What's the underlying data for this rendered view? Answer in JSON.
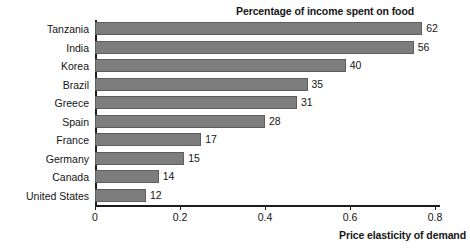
{
  "chart_data": {
    "type": "bar",
    "orientation": "horizontal",
    "title": "Percentage of income spent on food",
    "xlabel": "Price elasticity of demand",
    "ylabel": "",
    "xlim": [
      0,
      0.85
    ],
    "xticks": [
      "0",
      "0.2",
      "0.4",
      "0.6",
      "0.8"
    ],
    "xtick_values": [
      0,
      0.2,
      0.4,
      0.6,
      0.8
    ],
    "grid": false,
    "legend": false,
    "categories": [
      "Tanzania",
      "India",
      "Korea",
      "Brazil",
      "Greece",
      "Spain",
      "France",
      "Germany",
      "Canada",
      "United States"
    ],
    "values": [
      0.77,
      0.75,
      0.59,
      0.5,
      0.475,
      0.4,
      0.25,
      0.21,
      0.15,
      0.12
    ],
    "data_labels": [
      "62",
      "56",
      "40",
      "35",
      "31",
      "28",
      "17",
      "15",
      "14",
      "12"
    ],
    "data_label_meaning": "Percentage of income spent on food",
    "points": [
      {
        "category": "Tanzania",
        "elasticity": 0.77,
        "pct_income_on_food": "62"
      },
      {
        "category": "India",
        "elasticity": 0.75,
        "pct_income_on_food": "56"
      },
      {
        "category": "Korea",
        "elasticity": 0.59,
        "pct_income_on_food": "40"
      },
      {
        "category": "Brazil",
        "elasticity": 0.5,
        "pct_income_on_food": "35"
      },
      {
        "category": "Greece",
        "elasticity": 0.475,
        "pct_income_on_food": "31"
      },
      {
        "category": "Spain",
        "elasticity": 0.4,
        "pct_income_on_food": "28"
      },
      {
        "category": "France",
        "elasticity": 0.25,
        "pct_income_on_food": "17"
      },
      {
        "category": "Germany",
        "elasticity": 0.21,
        "pct_income_on_food": "15"
      },
      {
        "category": "Canada",
        "elasticity": 0.15,
        "pct_income_on_food": "14"
      },
      {
        "category": "United States",
        "elasticity": 0.12,
        "pct_income_on_food": "12"
      }
    ],
    "colors": {
      "bar_fill": "#7d7d7d",
      "bar_border": "#5e5e5e",
      "axis": "#1b1b1b",
      "text": "#141414",
      "background": "#ffffff"
    }
  }
}
